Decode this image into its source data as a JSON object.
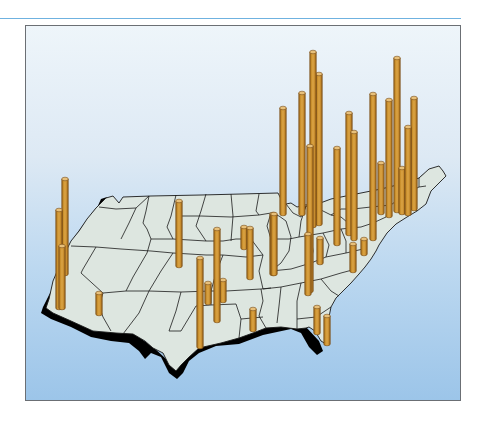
{
  "figure": {
    "title": "",
    "description": "3D relief map of the contiguous United States with vertical cylinder bars at city locations",
    "colors": {
      "rule": "#6fb2e0",
      "frame_border": "#6b6f74",
      "background_top": "#eef5fa",
      "background_bottom": "#9cc5e9",
      "land_fill": "#dde6e0",
      "land_shadow": "#000000",
      "state_lines": "#1a1a1a",
      "bar_body": "#c9922f",
      "bar_edge": "#7a4e15",
      "bar_highlight": "#e3b25a",
      "bar_top": "#e8c07a"
    }
  },
  "chart_data": {
    "type": "3d-bar-map",
    "title": "",
    "xlabel": "",
    "ylabel": "",
    "legend": [],
    "region": "Contiguous United States",
    "bars_note": "Bar heights in pixels as rendered (relative magnitudes); no numeric axis shown",
    "bars": [
      {
        "region": "Pacific Northwest (Seattle area)",
        "x": 64,
        "top": 178,
        "base": 273,
        "height": 95
      },
      {
        "region": "Northern California (San Francisco area)",
        "x": 58,
        "top": 209,
        "base": 307,
        "height": 98
      },
      {
        "region": "Southern California (Los Angeles area)",
        "x": 61,
        "top": 245,
        "base": 307,
        "height": 62
      },
      {
        "region": "Arizona (Phoenix area)",
        "x": 98,
        "top": 292,
        "base": 313,
        "height": 21
      },
      {
        "region": "Colorado (Denver area)",
        "x": 178,
        "top": 200,
        "base": 265,
        "height": 65
      },
      {
        "region": "Texas (Dallas area)",
        "x": 199,
        "top": 257,
        "base": 346,
        "height": 89
      },
      {
        "region": "Oklahoma/Texas",
        "x": 216,
        "top": 228,
        "base": 320,
        "height": 92
      },
      {
        "region": "Oklahoma",
        "x": 207,
        "top": 282,
        "base": 302,
        "height": 20
      },
      {
        "region": "Oklahoma/Arkansas",
        "x": 222,
        "top": 279,
        "base": 300,
        "height": 21
      },
      {
        "region": "Kansas/Missouri (Kansas City area)",
        "x": 243,
        "top": 226,
        "base": 247,
        "height": 21
      },
      {
        "region": "Missouri",
        "x": 249,
        "top": 227,
        "base": 277,
        "height": 50
      },
      {
        "region": "Illinois (St. Louis area)",
        "x": 272,
        "top": 213,
        "base": 273,
        "height": 60
      },
      {
        "region": "Louisiana (New Orleans area)",
        "x": 252,
        "top": 308,
        "base": 329,
        "height": 21
      },
      {
        "region": "Wisconsin/Illinois",
        "x": 273,
        "top": 213,
        "base": 273,
        "height": 60
      },
      {
        "region": "Illinois (Chicago area)",
        "x": 282,
        "top": 107,
        "base": 213,
        "height": 106
      },
      {
        "region": "Michigan",
        "x": 301,
        "top": 92,
        "base": 213,
        "height": 121
      },
      {
        "region": "Michigan (Detroit area)",
        "x": 312,
        "top": 51,
        "base": 225,
        "height": 174
      },
      {
        "region": "Ohio",
        "x": 318,
        "top": 73,
        "base": 223,
        "height": 150
      },
      {
        "region": "Ohio/Kentucky",
        "x": 309,
        "top": 145,
        "base": 290,
        "height": 145
      },
      {
        "region": "Georgia (Atlanta area)",
        "x": 307,
        "top": 233,
        "base": 293,
        "height": 60
      },
      {
        "region": "Tennessee",
        "x": 319,
        "top": 237,
        "base": 262,
        "height": 25
      },
      {
        "region": "Pennsylvania (Pittsburgh area)",
        "x": 336,
        "top": 147,
        "base": 243,
        "height": 96
      },
      {
        "region": "New York (upstate)",
        "x": 348,
        "top": 112,
        "base": 233,
        "height": 121
      },
      {
        "region": "Pennsylvania",
        "x": 353,
        "top": 131,
        "base": 238,
        "height": 107
      },
      {
        "region": "Virginia",
        "x": 352,
        "top": 243,
        "base": 270,
        "height": 27
      },
      {
        "region": "Maryland/DC",
        "x": 363,
        "top": 238,
        "base": 253,
        "height": 15
      },
      {
        "region": "New Jersey/Pennsylvania (Philadelphia area)",
        "x": 372,
        "top": 93,
        "base": 238,
        "height": 145
      },
      {
        "region": "New York",
        "x": 380,
        "top": 162,
        "base": 212,
        "height": 50
      },
      {
        "region": "New York City area",
        "x": 388,
        "top": 99,
        "base": 215,
        "height": 116
      },
      {
        "region": "Connecticut/New York",
        "x": 396,
        "top": 57,
        "base": 210,
        "height": 153
      },
      {
        "region": "Connecticut",
        "x": 401,
        "top": 167,
        "base": 212,
        "height": 45
      },
      {
        "region": "Rhode Island/Massachusetts",
        "x": 407,
        "top": 126,
        "base": 213,
        "height": 87
      },
      {
        "region": "Massachusetts (Boston area)",
        "x": 413,
        "top": 97,
        "base": 208,
        "height": 111
      },
      {
        "region": "Florida (Jacksonville area)",
        "x": 316,
        "top": 306,
        "base": 332,
        "height": 26
      },
      {
        "region": "Florida (Orlando/Tampa area)",
        "x": 326,
        "top": 315,
        "base": 343,
        "height": 28
      }
    ]
  }
}
